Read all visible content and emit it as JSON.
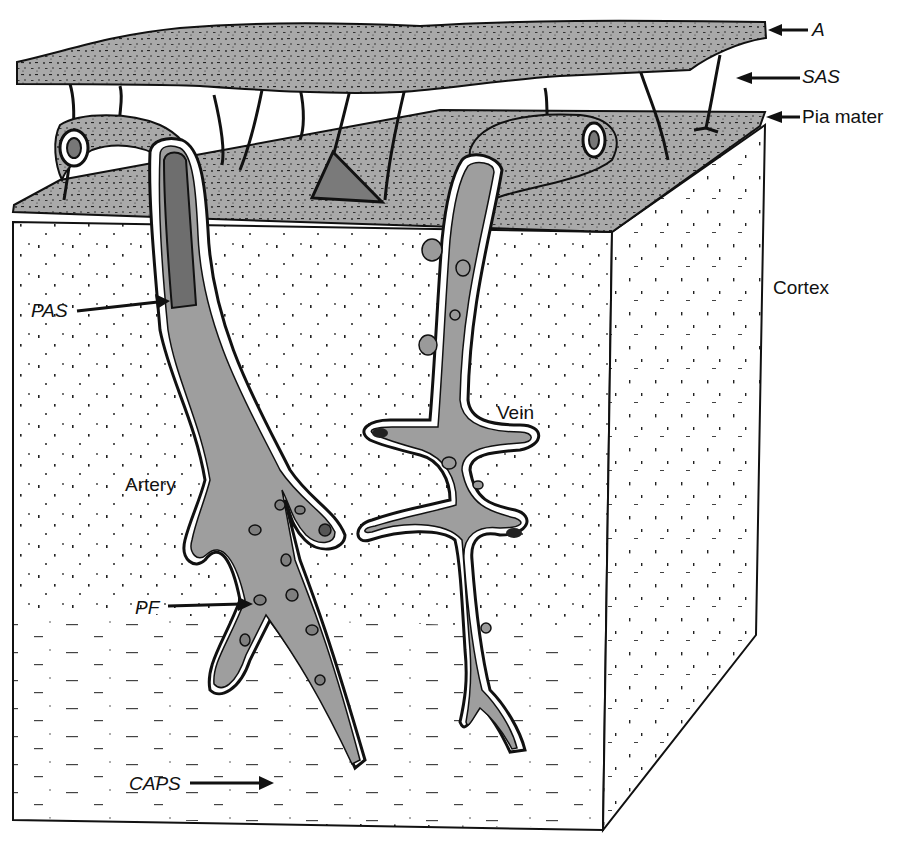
{
  "figure": {
    "colors": {
      "membrane_fill": "#a9a9a9",
      "vessel_fill": "#9e9e9e",
      "artery_lumen_dark": "#6e6e6e",
      "outline": "#111111",
      "cortex_fill": "#ffffff",
      "triangle_dark": "#7a7a7a"
    }
  },
  "labels": {
    "arachnoid": {
      "text": "A",
      "x": 812,
      "y": 20
    },
    "sas": {
      "text": "SAS",
      "x": 802,
      "y": 67
    },
    "pia_mater": {
      "text": "Pia mater",
      "x": 802,
      "y": 107
    },
    "cortex": {
      "text": "Cortex",
      "x": 773,
      "y": 278
    },
    "pas": {
      "text": "PAS",
      "x": 31,
      "y": 301
    },
    "artery": {
      "text": "Artery",
      "x": 125,
      "y": 475
    },
    "vein": {
      "text": "Vein",
      "x": 497,
      "y": 403
    },
    "pf": {
      "text": "PF",
      "x": 135,
      "y": 598
    },
    "caps": {
      "text": "CAPS",
      "x": 129,
      "y": 774
    }
  }
}
